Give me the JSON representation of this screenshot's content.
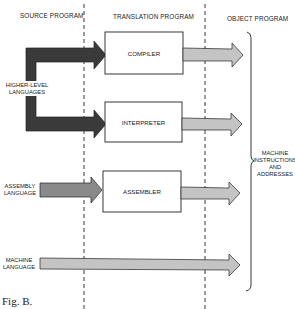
{
  "headers": {
    "source": "SOURCE PROGRAM",
    "translation": "TRANSLATION PROGRAM",
    "object": "OBJECT PROGRAM"
  },
  "boxes": {
    "compiler": "COMPILER",
    "interpreter": "INTERPRETER",
    "assembler": "ASSEMBLER"
  },
  "inputs": {
    "higher_level": [
      "HIGHER-LEVEL",
      "LANGUAGES"
    ],
    "assembly": [
      "ASSEMBLY",
      "LANGUAGE"
    ],
    "machine": [
      "MACHINE",
      "LANGUAGE"
    ]
  },
  "output_label": [
    "MACHINE",
    "INSTRUCTIONS",
    "AND",
    "ADDRESSES"
  ],
  "caption": "Fig. B.",
  "colors": {
    "dark_arrow": "#3a3a3a",
    "medium_arrow": "#8a8a8a",
    "light_arrow": "#c4c4c4",
    "stroke": "#222222"
  }
}
